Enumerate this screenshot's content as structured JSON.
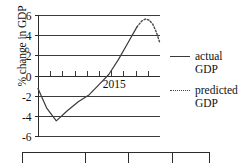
{
  "chart_data": {
    "type": "line",
    "title": "",
    "xlabel": "",
    "ylabel": "% change in GDP",
    "ylim": [
      -6,
      6
    ],
    "ytick_labels": [
      "6",
      "4",
      "2",
      "0",
      "-2",
      "-4",
      "-6"
    ],
    "ytick_values": [
      6,
      4,
      2,
      0,
      -2,
      -4,
      -6
    ],
    "grid": true,
    "x_axis_annotation": "2015",
    "x_tick_count": 9,
    "legend_position": "right",
    "series": [
      {
        "name": "actual GDP",
        "style": "solid",
        "color": "#3a3a3a",
        "x": [
          0.0,
          0.07,
          0.15,
          0.24,
          0.33,
          0.42,
          0.5,
          0.58,
          0.66,
          0.74,
          0.81
        ],
        "values": [
          -1.3,
          -3.2,
          -4.5,
          -3.5,
          -2.6,
          -1.9,
          -0.9,
          0.1,
          1.6,
          3.3,
          4.8
        ]
      },
      {
        "name": "predicted GDP",
        "style": "dotted",
        "color": "#4a4a4a",
        "x": [
          0.81,
          0.85,
          0.88,
          0.91,
          0.94,
          0.97,
          1.0
        ],
        "values": [
          4.8,
          5.4,
          5.6,
          5.5,
          5.1,
          4.3,
          3.2
        ]
      }
    ]
  },
  "legend": {
    "entries": [
      {
        "label_line1": "actual",
        "label_line2": "GDP",
        "style": "solid"
      },
      {
        "label_line1": "predicted",
        "label_line2": "GDP",
        "style": "dotted"
      }
    ]
  },
  "bottom_table": {
    "column_divider_fractions": [
      0.33,
      0.56,
      0.79
    ]
  },
  "colors": {
    "axis": "#2c2c2c",
    "grid": "#3a3a3a",
    "actual": "#3a3a3a",
    "predicted": "#4a4a4a",
    "text": "#111111",
    "background": "#ffffff"
  }
}
